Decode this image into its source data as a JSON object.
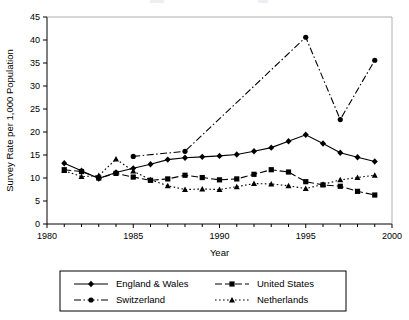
{
  "chart_data": {
    "type": "line",
    "title": "",
    "xlabel": "Year",
    "ylabel": "Survey Rate per 1,000 Population",
    "xlim": [
      1980,
      2000
    ],
    "ylim": [
      0,
      45
    ],
    "ytick_step": 5,
    "xtick_step": 5,
    "xminor_step": 1,
    "grid": false,
    "legend_position": "bottom",
    "xticks": [
      "1980",
      "1985",
      "1990",
      "1995",
      "2000"
    ],
    "yticks": [
      "0",
      "5",
      "10",
      "15",
      "20",
      "25",
      "30",
      "35",
      "40",
      "45"
    ],
    "series": [
      {
        "name": "England & Wales",
        "marker": "diamond",
        "linestyle": "solid",
        "color": "#000000",
        "points": [
          {
            "x": 1981,
            "y": 13.2
          },
          {
            "x": 1982,
            "y": 11.6
          },
          {
            "x": 1983,
            "y": 9.9
          },
          {
            "x": 1984,
            "y": 11.2
          },
          {
            "x": 1985,
            "y": 12.1
          },
          {
            "x": 1986,
            "y": 13.0
          },
          {
            "x": 1987,
            "y": 14.0
          },
          {
            "x": 1988,
            "y": 14.4
          },
          {
            "x": 1989,
            "y": 14.6
          },
          {
            "x": 1990,
            "y": 14.8
          },
          {
            "x": 1991,
            "y": 15.1
          },
          {
            "x": 1992,
            "y": 15.8
          },
          {
            "x": 1993,
            "y": 16.6
          },
          {
            "x": 1994,
            "y": 18.0
          },
          {
            "x": 1995,
            "y": 19.4
          },
          {
            "x": 1996,
            "y": 17.5
          },
          {
            "x": 1997,
            "y": 15.5
          },
          {
            "x": 1998,
            "y": 14.5
          },
          {
            "x": 1999,
            "y": 13.6
          }
        ]
      },
      {
        "name": "United States",
        "marker": "square",
        "linestyle": "dashed",
        "color": "#000000",
        "points": [
          {
            "x": 1981,
            "y": 11.8
          },
          {
            "x": 1982,
            "y": 11.4
          },
          {
            "x": 1983,
            "y": 10.0
          },
          {
            "x": 1984,
            "y": 11.0
          },
          {
            "x": 1985,
            "y": 10.2
          },
          {
            "x": 1986,
            "y": 9.5
          },
          {
            "x": 1987,
            "y": 9.8
          },
          {
            "x": 1988,
            "y": 10.6
          },
          {
            "x": 1989,
            "y": 10.1
          },
          {
            "x": 1990,
            "y": 9.6
          },
          {
            "x": 1991,
            "y": 9.8
          },
          {
            "x": 1992,
            "y": 10.8
          },
          {
            "x": 1993,
            "y": 11.8
          },
          {
            "x": 1994,
            "y": 11.3
          },
          {
            "x": 1995,
            "y": 9.2
          },
          {
            "x": 1996,
            "y": 8.5
          },
          {
            "x": 1997,
            "y": 8.2
          },
          {
            "x": 1998,
            "y": 7.1
          },
          {
            "x": 1999,
            "y": 6.3
          }
        ]
      },
      {
        "name": "Switzerland",
        "marker": "circle",
        "linestyle": "dashdot",
        "color": "#000000",
        "points": [
          {
            "x": 1985,
            "y": 14.7
          },
          {
            "x": 1988,
            "y": 15.8
          },
          {
            "x": 1995,
            "y": 40.6
          },
          {
            "x": 1997,
            "y": 22.7
          },
          {
            "x": 1999,
            "y": 35.6
          }
        ]
      },
      {
        "name": "Netherlands",
        "marker": "triangle",
        "linestyle": "dotted",
        "color": "#000000",
        "points": [
          {
            "x": 1981,
            "y": 11.6
          },
          {
            "x": 1982,
            "y": 10.3
          },
          {
            "x": 1983,
            "y": 10.5
          },
          {
            "x": 1984,
            "y": 14.1
          },
          {
            "x": 1985,
            "y": 11.5
          },
          {
            "x": 1986,
            "y": 9.6
          },
          {
            "x": 1987,
            "y": 8.3
          },
          {
            "x": 1988,
            "y": 7.5
          },
          {
            "x": 1989,
            "y": 7.6
          },
          {
            "x": 1990,
            "y": 7.5
          },
          {
            "x": 1991,
            "y": 8.1
          },
          {
            "x": 1992,
            "y": 8.8
          },
          {
            "x": 1993,
            "y": 8.7
          },
          {
            "x": 1994,
            "y": 8.3
          },
          {
            "x": 1995,
            "y": 7.7
          },
          {
            "x": 1996,
            "y": 8.6
          },
          {
            "x": 1997,
            "y": 9.6
          },
          {
            "x": 1998,
            "y": 10.1
          },
          {
            "x": 1999,
            "y": 10.6
          }
        ]
      }
    ]
  },
  "legend": {
    "entries": [
      {
        "label": "England & Wales"
      },
      {
        "label": "United States"
      },
      {
        "label": "Switzerland"
      },
      {
        "label": "Netherlands"
      }
    ]
  }
}
